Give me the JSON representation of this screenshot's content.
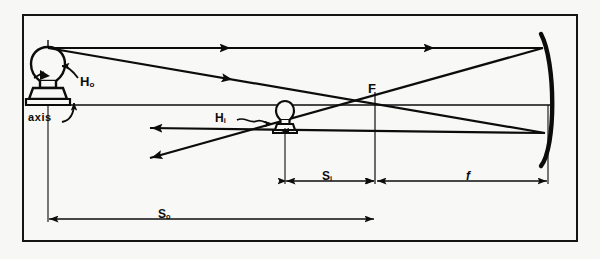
{
  "diagram": {
    "background_color": "#f7f7f5",
    "ink_color": "#0c0c0c",
    "frame": {
      "border_color": "#151515",
      "border_width_px": 2
    },
    "labels": {
      "object_height": {
        "text": "H",
        "sub": "o"
      },
      "image_height": {
        "text": "H",
        "sub": "i"
      },
      "axis": {
        "text": "axis"
      },
      "focal_point": {
        "text": "F"
      },
      "image_distance": {
        "text": "S",
        "sub": "i"
      },
      "focal_length": {
        "text": "f"
      },
      "object_distance": {
        "text": "S",
        "sub": "o"
      }
    },
    "elements": {
      "object": {
        "name": "light-bulb-object",
        "orientation": "upright",
        "x_px": 48,
        "base_y_px": 105
      },
      "image": {
        "name": "light-bulb-image",
        "orientation": "inverted",
        "x_px": 285,
        "base_y_px": 105
      },
      "mirror": {
        "name": "concave-mirror",
        "vertex_x_px": 548,
        "curvature": "concave-left"
      },
      "principal_axis": {
        "y_px": 105,
        "from_x_px": 30,
        "to_x_px": 548
      }
    },
    "rays": [
      {
        "name": "parallel-incident-ray",
        "from": [
          48,
          48
        ],
        "to": [
          543,
          48
        ],
        "direction": "right"
      },
      {
        "name": "reflected-through-focus-ray",
        "from": [
          543,
          48
        ],
        "to": [
          150,
          158
        ],
        "direction": "left"
      },
      {
        "name": "through-focus-incident-ray",
        "from": [
          48,
          48
        ],
        "to": [
          543,
          133
        ],
        "direction": "right"
      },
      {
        "name": "reflected-parallel-ray",
        "from": [
          543,
          133
        ],
        "to": [
          150,
          128
        ],
        "direction": "left"
      }
    ],
    "dimensions": [
      {
        "name": "image-distance-dim",
        "label": "Si",
        "from_x_px": 285,
        "to_x_px": 375,
        "y_px": 181
      },
      {
        "name": "focal-length-dim",
        "label": "f",
        "from_x_px": 375,
        "to_x_px": 548,
        "y_px": 181
      },
      {
        "name": "object-distance-dim",
        "label": "So",
        "from_x_px": 48,
        "to_x_px": 375,
        "y_px": 219
      }
    ]
  }
}
